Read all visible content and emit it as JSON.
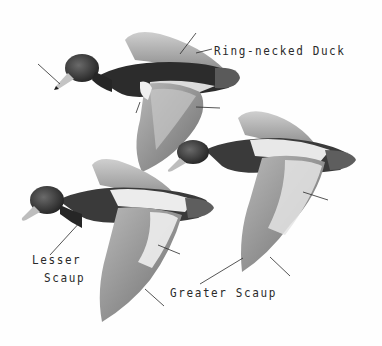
{
  "figure": {
    "type": "field-guide illustration",
    "style": "grayscale painting",
    "background": "#fefefe",
    "ink_color": "#2a2a2a"
  },
  "labels": {
    "ring_necked": "Ring-necked Duck",
    "lesser_line1": "Lesser",
    "lesser_line2": "Scaup",
    "greater": "Greater Scaup"
  },
  "birds": [
    {
      "name": "Ring-necked Duck",
      "position": "top-left",
      "pointers": 4
    },
    {
      "name": "Greater Scaup",
      "position": "middle-right",
      "pointers": 3
    },
    {
      "name": "Lesser Scaup",
      "position": "bottom-left",
      "pointers": 3
    }
  ]
}
